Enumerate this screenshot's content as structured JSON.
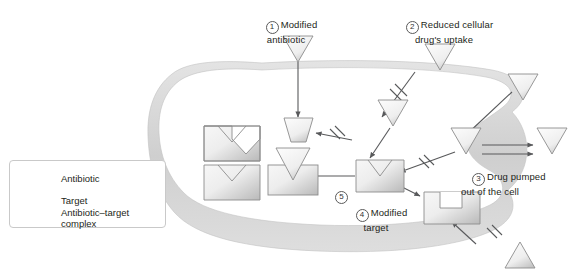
{
  "figure": {
    "type": "diagram",
    "background_color": "#ffffff",
    "shape_fill": "#e9e9e9",
    "shape_stroke": "#8c8c8c",
    "membrane_color": "#d6d6d6",
    "arrow_color": "#58595b"
  },
  "legend": {
    "items": [
      {
        "icon": "triangle-down-icon",
        "label": "Antibiotic"
      },
      {
        "icon": "target-v-notch-icon",
        "label": "Target"
      },
      {
        "icon": "antibiotic-target-complex-icon",
        "label": "Antibiotic–target\ncomplex"
      }
    ]
  },
  "mechanisms": [
    {
      "number": "1",
      "label": "Modified\nantibiotic"
    },
    {
      "number": "2",
      "label": "Reduced cellular\ndrug's uptake"
    },
    {
      "number": "3",
      "label": "Drug pumped\nout of the cell"
    },
    {
      "number": "4",
      "label": "Modified\ntarget"
    },
    {
      "number": "5",
      "label": ""
    }
  ],
  "elements": {
    "free_targets": 2,
    "complexes": 1,
    "modified_antibiotic": "trapezoid",
    "modified_target": "square-u-notch",
    "blocked_arrows": 4,
    "efflux_arrows": 2
  }
}
